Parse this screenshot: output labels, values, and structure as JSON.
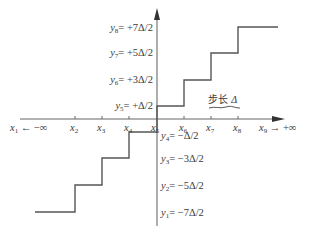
{
  "diagram": {
    "type": "quantizer-staircase",
    "colors": {
      "line": "#555555",
      "axis": "#666666",
      "text": "#3a3a3a",
      "background": "#ffffff"
    },
    "x_axis": {
      "labels": [
        {
          "var": "x",
          "sub": "1",
          "suffix": " ← −∞"
        },
        {
          "var": "x",
          "sub": "2",
          "suffix": ""
        },
        {
          "var": "x",
          "sub": "3",
          "suffix": ""
        },
        {
          "var": "x",
          "sub": "4",
          "suffix": ""
        },
        {
          "var": "x",
          "sub": "5",
          "suffix": ""
        },
        {
          "var": "x",
          "sub": "6",
          "suffix": ""
        },
        {
          "var": "x",
          "sub": "7",
          "suffix": ""
        },
        {
          "var": "x",
          "sub": "8",
          "suffix": ""
        },
        {
          "var": "x",
          "sub": "9",
          "suffix": " → +∞"
        }
      ]
    },
    "y_levels": [
      {
        "var": "y",
        "sub": "8",
        "value": "= +7Δ/2"
      },
      {
        "var": "y",
        "sub": "7",
        "value": "= +5Δ/2"
      },
      {
        "var": "y",
        "sub": "6",
        "value": "= +3Δ/2"
      },
      {
        "var": "y",
        "sub": "5",
        "value": "= +Δ/2"
      },
      {
        "var": "y",
        "sub": "4",
        "value": "= −Δ/2"
      },
      {
        "var": "y",
        "sub": "3",
        "value": "= −3Δ/2"
      },
      {
        "var": "y",
        "sub": "2",
        "value": "= −5Δ/2"
      },
      {
        "var": "y",
        "sub": "1",
        "value": "= −7Δ/2"
      }
    ],
    "step_label": {
      "text": "步长 ",
      "delta": "Δ"
    }
  }
}
